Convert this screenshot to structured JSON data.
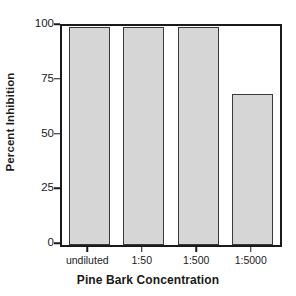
{
  "chart_data": {
    "type": "bar",
    "title": "",
    "xlabel": "Pine Bark Concentration",
    "ylabel": "Percent Inhibition",
    "categories": [
      "undiluted",
      "1:50",
      "1:500",
      "1:5000"
    ],
    "values": [
      99.5,
      99.5,
      99.5,
      69
    ],
    "ylim": [
      0,
      100
    ],
    "yticks": [
      0,
      25,
      50,
      75,
      100
    ],
    "ytick_labels": [
      "0",
      "25",
      "50",
      "75",
      "100"
    ],
    "grid": false,
    "legend": null,
    "bar_fill_color": "#d6d6d6",
    "bar_edge_color": "#3a3a3a",
    "axis_color": "#1a1a1a",
    "background_color": "#ffffff"
  }
}
